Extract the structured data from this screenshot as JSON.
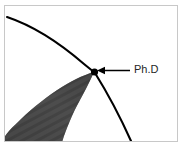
{
  "figure": {
    "title": "",
    "background_color": "#ffffff",
    "frame": {
      "name": "image-frame",
      "border_color": "#c8c8c8",
      "border_width": 1
    },
    "annotation": {
      "label": "Ph.D",
      "text_color": "#262626",
      "font_size_px": 11,
      "pointer": {
        "name": "annotation-arrow",
        "color": "#000000",
        "direction": "left",
        "from_x": 130,
        "from_y": 71,
        "to_x": 97,
        "to_y": 71
      }
    },
    "marker": {
      "name": "intersection-point",
      "color": "#000000",
      "x": 94,
      "y": 72,
      "radius": 3.4
    },
    "curve": {
      "name": "boundary-arc",
      "color": "#000000",
      "stroke_width": 2.1,
      "description": "arc of knowledge boundary circle",
      "points": [
        [
          8,
          18
        ],
        [
          30,
          26
        ],
        [
          52,
          39
        ],
        [
          70,
          53
        ],
        [
          85,
          66
        ],
        [
          94,
          72
        ],
        [
          105,
          88
        ],
        [
          118,
          110
        ],
        [
          129,
          136
        ]
      ]
    },
    "wedge": {
      "name": "specialization-wedge",
      "fill_color": "#4a4a4a",
      "hatch_color": "#3a3a3a",
      "description": "hatched lens shape tapering to a point at the boundary",
      "tip_x": 94,
      "tip_y": 72
    }
  }
}
